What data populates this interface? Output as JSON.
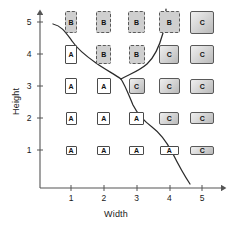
{
  "axes": {
    "x_label": "Width",
    "y_label": "Height",
    "x_ticks": [
      "1",
      "2",
      "3",
      "4",
      "5"
    ],
    "y_ticks": [
      "1",
      "2",
      "3",
      "4",
      "5"
    ]
  },
  "classes": {
    "a_label": "A",
    "b_label": "B",
    "c_label": "C"
  },
  "colors": {
    "class_a_fill": "#ffffff",
    "class_b_fill": "#cfcfcf",
    "class_c_fill": "#d2d2d2",
    "stroke": "#4a4a4a",
    "boundary": "#2b2b2b",
    "axis": "#555555"
  },
  "chart_data": {
    "type": "scatter",
    "title": "",
    "xlabel": "Width",
    "ylabel": "Height",
    "xlim": [
      0,
      5.6
    ],
    "ylim": [
      0,
      5.6
    ],
    "grid": false,
    "legend": "none",
    "x_ticklabels": [
      "1",
      "2",
      "3",
      "4",
      "5"
    ],
    "y_ticklabels": [
      "1",
      "2",
      "3",
      "4",
      "5"
    ],
    "point_label_key": "class",
    "points": [
      {
        "x": 1,
        "y": 5,
        "class": "B",
        "w": 12,
        "h": 22
      },
      {
        "x": 2,
        "y": 5,
        "class": "B",
        "w": 15,
        "h": 22
      },
      {
        "x": 3,
        "y": 5,
        "class": "B",
        "w": 17,
        "h": 22
      },
      {
        "x": 4,
        "y": 5,
        "class": "B",
        "w": 21,
        "h": 22
      },
      {
        "x": 5,
        "y": 5,
        "class": "C",
        "w": 24,
        "h": 23
      },
      {
        "x": 1,
        "y": 4,
        "class": "A",
        "w": 12,
        "h": 19
      },
      {
        "x": 2,
        "y": 4,
        "class": "B",
        "w": 15,
        "h": 19
      },
      {
        "x": 3,
        "y": 4,
        "class": "B",
        "w": 16,
        "h": 19
      },
      {
        "x": 4,
        "y": 4,
        "class": "C",
        "w": 20,
        "h": 19
      },
      {
        "x": 5,
        "y": 4,
        "class": "C",
        "w": 24,
        "h": 19
      },
      {
        "x": 1,
        "y": 3,
        "class": "A",
        "w": 12,
        "h": 16
      },
      {
        "x": 2,
        "y": 3,
        "class": "A",
        "w": 14,
        "h": 16
      },
      {
        "x": 3,
        "y": 3,
        "class": "C",
        "w": 16,
        "h": 16
      },
      {
        "x": 4,
        "y": 3,
        "class": "C",
        "w": 21,
        "h": 16
      },
      {
        "x": 5,
        "y": 3,
        "class": "C",
        "w": 24,
        "h": 15
      },
      {
        "x": 1,
        "y": 2,
        "class": "A",
        "w": 11,
        "h": 13
      },
      {
        "x": 2,
        "y": 2,
        "class": "A",
        "w": 13,
        "h": 13
      },
      {
        "x": 3,
        "y": 2,
        "class": "A",
        "w": 15,
        "h": 13
      },
      {
        "x": 4,
        "y": 2,
        "class": "C",
        "w": 20,
        "h": 13
      },
      {
        "x": 5,
        "y": 2,
        "class": "C",
        "w": 24,
        "h": 12
      },
      {
        "x": 1,
        "y": 1,
        "class": "A",
        "w": 11,
        "h": 9
      },
      {
        "x": 2,
        "y": 1,
        "class": "A",
        "w": 13,
        "h": 9
      },
      {
        "x": 3,
        "y": 1,
        "class": "A",
        "w": 15,
        "h": 9
      },
      {
        "x": 4,
        "y": 1,
        "class": "A",
        "w": 19,
        "h": 9
      },
      {
        "x": 5,
        "y": 1,
        "class": "C",
        "w": 24,
        "h": 9
      }
    ],
    "decision_boundaries": [
      {
        "name": "upper-left-branch",
        "description": "separates A region (left) from B region (upper right)",
        "path": "M 53,24 C 62,26 66,33 72,41 C 78,50 86,56 96,63 C 106,70 114,74 121,79"
      },
      {
        "name": "upper-right-branch",
        "description": "separates B region from C region on the right",
        "path": "M 121,79 C 130,74 139,71 147,64 C 156,56 160,44 163,33 C 165,23 166,16 166,9"
      },
      {
        "name": "lower-branch",
        "description": "separates A region from C region toward lower right",
        "path": "M 121,79 C 126,87 129,96 133,105 C 138,115 144,121 152,127 C 160,133 166,141 172,152 C 178,164 184,175 190,184"
      }
    ]
  }
}
